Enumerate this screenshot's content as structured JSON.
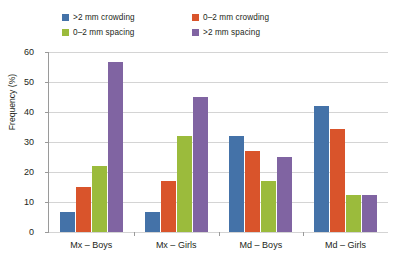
{
  "chart_data": {
    "type": "bar",
    "title": "",
    "xlabel": "",
    "ylabel": "Frequency (%)",
    "ylim": [
      0,
      60
    ],
    "yticks": [
      0,
      10,
      20,
      30,
      40,
      50,
      60
    ],
    "grid": true,
    "legend_position": "top",
    "categories": [
      "Mx – Boys",
      "Mx – Girls",
      "Md – Boys",
      "Md – Girls"
    ],
    "series": [
      {
        "name": ">2 mm crowding",
        "color": "#4472A8",
        "values": [
          6.7,
          6.7,
          32.0,
          42.0
        ]
      },
      {
        "name": "0–2 mm crowding",
        "color": "#D9542B",
        "values": [
          15.0,
          17.0,
          27.0,
          34.5
        ]
      },
      {
        "name": "0–2 mm spacing",
        "color": "#9BBB3C",
        "values": [
          22.0,
          32.0,
          17.0,
          12.5
        ]
      },
      {
        "name": ">2 mm spacing",
        "color": "#8064A2",
        "values": [
          56.7,
          45.0,
          25.0,
          12.5
        ]
      }
    ]
  },
  "axis": {
    "y_title": "Frequency (%)",
    "y_tick_labels": [
      "60",
      "50",
      "40",
      "30",
      "20",
      "10",
      "0"
    ],
    "x_tick_labels": [
      "Mx – Boys",
      "Mx – Girls",
      "Md – Boys",
      "Md – Girls"
    ]
  },
  "legend": {
    "items": [
      {
        "label": ">2 mm crowding",
        "color": "#4472A8"
      },
      {
        "label": "0–2 mm crowding",
        "color": "#D9542B"
      },
      {
        "label": "0–2 mm spacing",
        "color": "#9BBB3C"
      },
      {
        "label": ">2 mm spacing",
        "color": "#8064A2"
      }
    ]
  },
  "colors": {
    "gridline": "#d4d4d4",
    "axis": "#9a9a9a",
    "text": "#231f20",
    "background": "#ffffff"
  }
}
